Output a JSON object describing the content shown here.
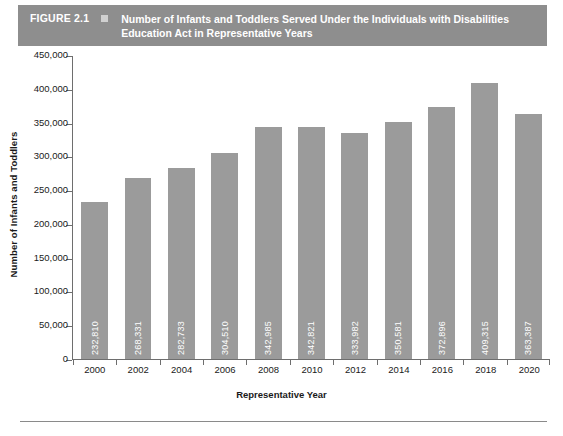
{
  "figure": {
    "number": "FIGURE 2.1",
    "bullet_icon": "square-marker",
    "title": "Number of Infants and Toddlers Served Under the Individuals with Disabilities Education Act in Representative Years",
    "header_bg": "#8e8e8e",
    "header_text_color": "#ffffff"
  },
  "chart_data": {
    "type": "bar",
    "title": "Number of Infants and Toddlers Served Under the Individuals with Disabilities Education Act in Representative Years",
    "xlabel": "Representative Year",
    "ylabel": "Number of Infants and Toddlers",
    "categories": [
      "2000",
      "2002",
      "2004",
      "2006",
      "2008",
      "2010",
      "2012",
      "2014",
      "2016",
      "2018",
      "2020"
    ],
    "values": [
      232810,
      268331,
      282733,
      304510,
      342985,
      342821,
      333982,
      350581,
      372896,
      409315,
      363387
    ],
    "value_labels": [
      "232,810",
      "268,331",
      "282,733",
      "304,510",
      "342,985",
      "342,821",
      "333,982",
      "350,581",
      "372,896",
      "409,315",
      "363,387"
    ],
    "ylim": [
      0,
      450000
    ],
    "ytick_values": [
      0,
      50000,
      100000,
      150000,
      200000,
      250000,
      300000,
      350000,
      400000,
      450000
    ],
    "ytick_labels": [
      "0",
      "50,000",
      "100,000",
      "150,000",
      "200,000",
      "250,000",
      "300,000",
      "350,000",
      "400,000",
      "450,000"
    ],
    "grid": false,
    "legend": null,
    "bar_color": "#9b9b9b",
    "value_label_color": "#ffffff",
    "axis_color": "#6e6e6e"
  }
}
